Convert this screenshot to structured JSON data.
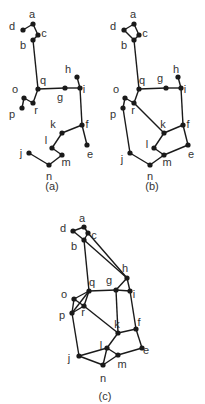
{
  "colors": {
    "line": "#1a1a1a",
    "text": "#333333",
    "background": "#ffffff"
  },
  "figures": [
    {
      "caption": "(a)",
      "caption_pos": [
        52,
        190
      ],
      "nodes": {
        "a": {
          "x": 33,
          "y": 24,
          "lx": 32,
          "ly": 18
        },
        "d": {
          "x": 23,
          "y": 30,
          "lx": 12,
          "ly": 30
        },
        "c": {
          "x": 38,
          "y": 35,
          "lx": 44,
          "ly": 37
        },
        "b": {
          "x": 33,
          "y": 40,
          "lx": 23,
          "ly": 49
        },
        "q": {
          "x": 38,
          "y": 89,
          "lx": 43,
          "ly": 84
        },
        "g": {
          "x": 65,
          "y": 88,
          "lx": 60,
          "ly": 101
        },
        "i": {
          "x": 80,
          "y": 88,
          "lx": 84,
          "ly": 93
        },
        "h": {
          "x": 77,
          "y": 77,
          "lx": 68,
          "ly": 73
        },
        "o": {
          "x": 24,
          "y": 98,
          "lx": 15,
          "ly": 93
        },
        "p": {
          "x": 22,
          "y": 108,
          "lx": 12,
          "ly": 118
        },
        "r": {
          "x": 33,
          "y": 103,
          "lx": 36,
          "ly": 114
        },
        "f": {
          "x": 82,
          "y": 125,
          "lx": 87,
          "ly": 128
        },
        "e": {
          "x": 87,
          "y": 145,
          "lx": 90,
          "ly": 158
        },
        "k": {
          "x": 62,
          "y": 133,
          "lx": 53,
          "ly": 128
        },
        "l": {
          "x": 52,
          "y": 148,
          "lx": 46,
          "ly": 144
        },
        "m": {
          "x": 62,
          "y": 155,
          "lx": 66,
          "ly": 166
        },
        "n": {
          "x": 49,
          "y": 165,
          "lx": 49,
          "ly": 180
        },
        "j": {
          "x": 29,
          "y": 153,
          "lx": 21,
          "ly": 157
        }
      },
      "edges": [
        [
          "d",
          "a"
        ],
        [
          "a",
          "c"
        ],
        [
          "c",
          "b"
        ],
        [
          "b",
          "q"
        ],
        [
          "q",
          "g"
        ],
        [
          "g",
          "i"
        ],
        [
          "h",
          "i"
        ],
        [
          "i",
          "f"
        ],
        [
          "q",
          "r"
        ],
        [
          "r",
          "o"
        ],
        [
          "o",
          "p"
        ],
        [
          "f",
          "e"
        ],
        [
          "f",
          "k"
        ],
        [
          "k",
          "l"
        ],
        [
          "l",
          "m"
        ],
        [
          "m",
          "n"
        ],
        [
          "n",
          "j"
        ]
      ]
    },
    {
      "caption": "(b)",
      "caption_pos": [
        152,
        190
      ],
      "nodes": {
        "a": {
          "x": 134,
          "y": 24,
          "lx": 133,
          "ly": 18
        },
        "d": {
          "x": 124,
          "y": 30,
          "lx": 113,
          "ly": 30
        },
        "c": {
          "x": 139,
          "y": 35,
          "lx": 145,
          "ly": 37
        },
        "b": {
          "x": 134,
          "y": 40,
          "lx": 124,
          "ly": 49
        },
        "q": {
          "x": 139,
          "y": 89,
          "lx": 142,
          "ly": 84
        },
        "g": {
          "x": 166,
          "y": 88,
          "lx": 160,
          "ly": 82
        },
        "i": {
          "x": 181,
          "y": 88,
          "lx": 185,
          "ly": 93
        },
        "h": {
          "x": 178,
          "y": 77,
          "lx": 176,
          "ly": 73
        },
        "o": {
          "x": 125,
          "y": 98,
          "lx": 116,
          "ly": 93
        },
        "p": {
          "x": 123,
          "y": 108,
          "lx": 113,
          "ly": 118
        },
        "r": {
          "x": 134,
          "y": 103,
          "lx": 133,
          "ly": 114
        },
        "f": {
          "x": 183,
          "y": 125,
          "lx": 188,
          "ly": 128
        },
        "e": {
          "x": 188,
          "y": 145,
          "lx": 191,
          "ly": 158
        },
        "k": {
          "x": 164,
          "y": 133,
          "lx": 163,
          "ly": 128
        },
        "l": {
          "x": 154,
          "y": 148,
          "lx": 147,
          "ly": 148
        },
        "m": {
          "x": 164,
          "y": 155,
          "lx": 167,
          "ly": 166
        },
        "n": {
          "x": 150,
          "y": 165,
          "lx": 150,
          "ly": 180
        },
        "j": {
          "x": 130,
          "y": 153,
          "lx": 122,
          "ly": 163
        }
      },
      "edges": [
        [
          "d",
          "a"
        ],
        [
          "a",
          "c"
        ],
        [
          "c",
          "b"
        ],
        [
          "b",
          "d"
        ],
        [
          "b",
          "q"
        ],
        [
          "q",
          "g"
        ],
        [
          "g",
          "i"
        ],
        [
          "h",
          "i"
        ],
        [
          "i",
          "f"
        ],
        [
          "q",
          "r"
        ],
        [
          "r",
          "o"
        ],
        [
          "o",
          "p"
        ],
        [
          "p",
          "j"
        ],
        [
          "j",
          "n"
        ],
        [
          "n",
          "m"
        ],
        [
          "m",
          "l"
        ],
        [
          "l",
          "k"
        ],
        [
          "k",
          "f"
        ],
        [
          "f",
          "e"
        ],
        [
          "e",
          "m"
        ],
        [
          "r",
          "k"
        ]
      ]
    },
    {
      "caption": "(c)",
      "caption_pos": [
        105,
        400
      ],
      "nodes": {
        "a": {
          "x": 84,
          "y": 227,
          "lx": 82,
          "ly": 222
        },
        "d": {
          "x": 73,
          "y": 231,
          "lx": 63,
          "ly": 232
        },
        "c": {
          "x": 88,
          "y": 233,
          "lx": 94,
          "ly": 239
        },
        "b": {
          "x": 84,
          "y": 240,
          "lx": 74,
          "ly": 250
        },
        "h": {
          "x": 127,
          "y": 278,
          "lx": 125,
          "ly": 272
        },
        "q": {
          "x": 89,
          "y": 291,
          "lx": 92,
          "ly": 286
        },
        "g": {
          "x": 116,
          "y": 290,
          "lx": 109,
          "ly": 284
        },
        "i": {
          "x": 130,
          "y": 291,
          "lx": 134,
          "ly": 298
        },
        "o": {
          "x": 74,
          "y": 299,
          "lx": 64,
          "ly": 298
        },
        "p": {
          "x": 72,
          "y": 313,
          "lx": 62,
          "ly": 319
        },
        "r": {
          "x": 84,
          "y": 306,
          "lx": 83,
          "ly": 316
        },
        "k": {
          "x": 118,
          "y": 333,
          "lx": 117,
          "ly": 328
        },
        "f": {
          "x": 136,
          "y": 329,
          "lx": 139,
          "ly": 326
        },
        "e": {
          "x": 142,
          "y": 348,
          "lx": 146,
          "ly": 354
        },
        "l": {
          "x": 107,
          "y": 348,
          "lx": 101,
          "ly": 349
        },
        "m": {
          "x": 118,
          "y": 355,
          "lx": 122,
          "ly": 368
        },
        "n": {
          "x": 103,
          "y": 365,
          "lx": 103,
          "ly": 382
        },
        "j": {
          "x": 79,
          "y": 356,
          "lx": 69,
          "ly": 362
        }
      },
      "edges": [
        [
          "d",
          "a"
        ],
        [
          "a",
          "c"
        ],
        [
          "c",
          "b"
        ],
        [
          "b",
          "d"
        ],
        [
          "b",
          "h"
        ],
        [
          "c",
          "h"
        ],
        [
          "b",
          "q"
        ],
        [
          "q",
          "g"
        ],
        [
          "g",
          "i"
        ],
        [
          "g",
          "h"
        ],
        [
          "h",
          "i"
        ],
        [
          "g",
          "k"
        ],
        [
          "i",
          "f"
        ],
        [
          "q",
          "o"
        ],
        [
          "q",
          "r"
        ],
        [
          "q",
          "p"
        ],
        [
          "o",
          "r"
        ],
        [
          "o",
          "p"
        ],
        [
          "p",
          "r"
        ],
        [
          "r",
          "k"
        ],
        [
          "p",
          "j"
        ],
        [
          "j",
          "l"
        ],
        [
          "j",
          "n"
        ],
        [
          "l",
          "n"
        ],
        [
          "l",
          "m"
        ],
        [
          "n",
          "m"
        ],
        [
          "l",
          "k"
        ],
        [
          "k",
          "f"
        ],
        [
          "f",
          "e"
        ],
        [
          "e",
          "m"
        ]
      ]
    }
  ]
}
